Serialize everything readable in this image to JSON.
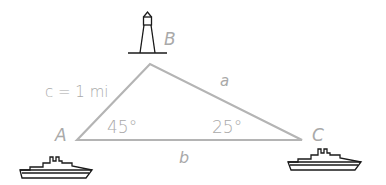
{
  "diagram": {
    "type": "triangle-navigation",
    "colors": {
      "triangle_stroke": "#b4b4b4",
      "label": "#a9a9a9",
      "icon_stroke": "#1a1a1a"
    },
    "vertices": {
      "A": {
        "label": "A",
        "angle": "45°",
        "icon": "ship-icon"
      },
      "B": {
        "label": "B",
        "icon": "lighthouse-icon"
      },
      "C": {
        "label": "C",
        "angle": "25°",
        "icon": "ship-icon"
      }
    },
    "sides": {
      "c": {
        "label": "c = 1 mi"
      },
      "a": {
        "label": "a"
      },
      "b": {
        "label": "b"
      }
    }
  }
}
